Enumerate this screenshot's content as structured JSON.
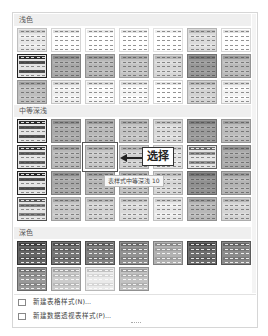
{
  "sections": [
    {
      "id": "light",
      "label": "浅色",
      "rows": 3,
      "cols": 7,
      "styles": [
        [
          "#c9c9c9",
          "#dedede",
          "#e6e6e6",
          "#e3e3e3",
          "#ececec",
          "#bdbdbd",
          "#e0e0e0"
        ],
        [
          "#2a2a2a",
          "#8a8a8a",
          "#9a9a9a",
          "#a5a5a5",
          "#b8b8b8",
          "#7a7a7a",
          "#9c9c9c"
        ],
        [
          "#a0a0a0",
          "#d0d0d0",
          "#d8d8d8",
          "#d6d6d6",
          "#e2e2e2",
          "#b4b4b4",
          "#d4d4d4"
        ]
      ]
    },
    {
      "id": "medium",
      "label": "中等深浅",
      "rows": 4,
      "cols": 7,
      "styles": [
        [
          "#2c2c2c",
          "#8c8c8c",
          "#9a9a9a",
          "#a5a5a5",
          "#bcbcbc",
          "#7c7c7c",
          "#9e9e9e"
        ],
        [
          "#3a3a3a",
          "#9a9a9a",
          "#a8a8a8",
          "#b0b0b0",
          "#c4c4c4",
          "#6a6a6a",
          "#8c8c8c"
        ],
        [
          "#2a2a2a",
          "#8a8a8a",
          "#989898",
          "#a2a2a2",
          "#b8b8b8",
          "#727272",
          "#969696"
        ],
        [
          "#5a5a5a",
          "#a8a8a8",
          "#b4b4b4",
          "#bcbcbc",
          "#cacaca",
          "#9a9a9a",
          "#b6b6b6"
        ]
      ]
    },
    {
      "id": "dark",
      "label": "深色",
      "rows": 2,
      "cols": 7,
      "styles": [
        [
          "#3c3c3c",
          "#4e4e4e",
          "#5a5a5a",
          "#6a6a6a",
          "#8a8a8a",
          "#454545",
          "#636363"
        ],
        [
          "#707070",
          "#a4a4a4",
          "#c2c2c2",
          "#9a9a9a"
        ]
      ]
    }
  ],
  "selected": {
    "section": "medium",
    "row": 1,
    "col": 2
  },
  "tooltip": "表样式中等深浅 10",
  "callout": "选择",
  "menu": [
    {
      "icon": "table-style-icon",
      "label": "新建表格样式(N)..."
    },
    {
      "icon": "pivot-style-icon",
      "label": "新建数据透视表样式(P)..."
    }
  ]
}
